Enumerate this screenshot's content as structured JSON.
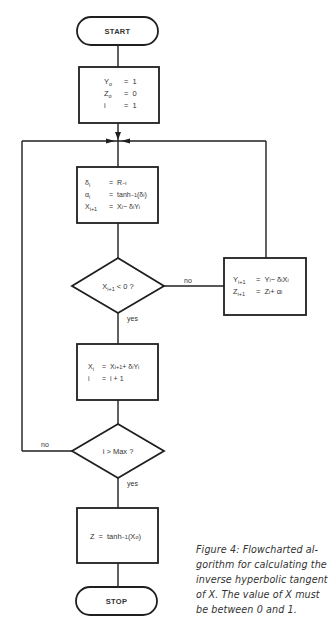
{
  "figure": {
    "nodes": {
      "start": {
        "label": "START"
      },
      "init": {
        "rows": [
          {
            "lhs": "Y",
            "sub": "o",
            "eq": "=",
            "rhs": "1"
          },
          {
            "lhs": "Z",
            "sub": "o",
            "eq": "=",
            "rhs": "0"
          },
          {
            "lhs": "i",
            "sub": "",
            "eq": "=",
            "rhs": "1"
          }
        ]
      },
      "compute": {
        "rows": [
          {
            "lhs": "δ",
            "sub": "i",
            "eq": "=",
            "rhs": "R",
            "rhs_sup": "−i"
          },
          {
            "lhs": "α",
            "sub": "i",
            "eq": "=",
            "rhs": "tanh",
            "rhs_sup": "−1",
            "rhs_tail": "(δ",
            "rhs_tail_sub": "i",
            "rhs_end": ")"
          },
          {
            "lhs": "X",
            "sub": "i+1",
            "eq": "=",
            "rhs": "X",
            "rhs_sub": "i",
            "rhs_tail": " − δ",
            "rhs_tail_sub": "i",
            "rhs_end": "Y",
            "rhs_end_sub": "i"
          }
        ]
      },
      "decision1": {
        "label": "X",
        "label_sub": "i+1",
        "label_tail": " < 0 ?"
      },
      "update_yz": {
        "rows": [
          {
            "lhs": "Y",
            "sub": "i+1",
            "eq": "=",
            "rhs": "Y",
            "rhs_sub": "i",
            "rhs_tail": " − δ",
            "rhs_tail_sub": "i",
            "rhs_end": "X",
            "rhs_end_sub": "i"
          },
          {
            "lhs": "Z",
            "sub": "i+1",
            "eq": "=",
            "rhs": "Z",
            "rhs_sub": "i",
            "rhs_tail": " + α",
            "rhs_tail_sub": "i",
            "rhs_end": "",
            "rhs_end_sub": ""
          }
        ]
      },
      "restore_x": {
        "rows": [
          {
            "lhs": "X",
            "sub": "i",
            "eq": "=",
            "rhs": "X",
            "rhs_sub": "i+1",
            "rhs_tail": " + δ",
            "rhs_tail_sub": "i",
            "rhs_end": "Y",
            "rhs_end_sub": "i"
          },
          {
            "lhs": "i",
            "sub": "",
            "eq": "=",
            "rhs": "i + 1",
            "rhs_sub": "",
            "rhs_tail": "",
            "rhs_tail_sub": "",
            "rhs_end": "",
            "rhs_end_sub": ""
          }
        ]
      },
      "decision2": {
        "label": "i > Max ?"
      },
      "result": {
        "lhs": "Z",
        "eq": "=",
        "rhs": "tanh",
        "rhs_sup": "−1",
        "rhs_tail": "(X",
        "rhs_tail_sub": "o",
        "rhs_end": ")"
      },
      "stop": {
        "label": "STOP"
      }
    },
    "edge_labels": {
      "decision1_no": "no",
      "decision1_yes": "yes",
      "decision2_no": "no",
      "decision2_yes": "yes"
    },
    "caption": {
      "lines": [
        "Figure 4: Flowcharted al-",
        "gorithm for calculating the",
        "inverse hyperbolic tangent",
        "of X. The value of X must",
        "be between 0 and 1."
      ]
    },
    "colors": {
      "stroke": "#1f1f1f",
      "text": "#333333",
      "background": "#ffffff"
    }
  }
}
